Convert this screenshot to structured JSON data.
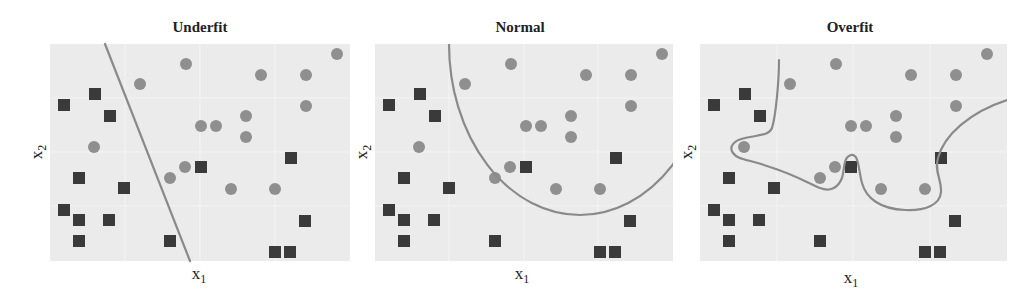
{
  "figure": {
    "colors": {
      "plot_background": "#ebebeb",
      "circle_class": "#8f8f8f",
      "square_class": "#3a3a3a",
      "boundary_line": "#8a8a8a",
      "text": "#222222"
    },
    "panels": [
      {
        "id": "underfit",
        "title": "Underfit",
        "xlabel": "x",
        "xlabel_sub": "1",
        "ylabel": "x",
        "ylabel_sub": "2",
        "boundary_type": "linear"
      },
      {
        "id": "normal",
        "title": "Normal",
        "xlabel": "x",
        "xlabel_sub": "1",
        "ylabel": "x",
        "ylabel_sub": "2",
        "boundary_type": "elliptical arc"
      },
      {
        "id": "overfit",
        "title": "Overfit",
        "xlabel": "x",
        "xlabel_sub": "1",
        "ylabel": "x",
        "ylabel_sub": "2",
        "boundary_type": "wiggly curve"
      }
    ]
  },
  "chart_data": [
    {
      "type": "scatter",
      "title": "Underfit",
      "xlabel": "x1",
      "ylabel": "x2",
      "grid": true,
      "legend": "none",
      "xlim": [
        0,
        300
      ],
      "ylim": [
        0,
        217
      ],
      "series": [
        {
          "name": "circle",
          "marker": "circle",
          "color": "#8f8f8f",
          "points": [
            [
              90,
              177
            ],
            [
              136,
              197
            ],
            [
              211,
              186
            ],
            [
              256,
              186
            ],
            [
              287,
              207
            ],
            [
              256,
              155
            ],
            [
              151,
              135
            ],
            [
              166,
              135
            ],
            [
              196,
              145
            ],
            [
              196,
              124
            ],
            [
              44,
              114
            ],
            [
              120,
              83
            ],
            [
              135,
              94
            ],
            [
              181,
              72
            ],
            [
              225,
              72
            ]
          ]
        },
        {
          "name": "square",
          "marker": "square",
          "color": "#3a3a3a",
          "points": [
            [
              14,
              156
            ],
            [
              45,
              167
            ],
            [
              60,
              145
            ],
            [
              29,
              83
            ],
            [
              74,
              73
            ],
            [
              14,
              51
            ],
            [
              29,
              41
            ],
            [
              59,
              41
            ],
            [
              29,
              20
            ],
            [
              120,
              20
            ],
            [
              151,
              94
            ],
            [
              241,
              103
            ],
            [
              255,
              40
            ],
            [
              225,
              9
            ],
            [
              240,
              9
            ]
          ]
        },
        {
          "name": "decision_boundary",
          "type": "line",
          "color": "#8a8a8a",
          "points": [
            [
              55,
              217
            ],
            [
              140,
              0
            ]
          ]
        }
      ]
    },
    {
      "type": "scatter",
      "title": "Normal",
      "xlabel": "x1",
      "ylabel": "x2",
      "grid": true,
      "legend": "none",
      "xlim": [
        0,
        298
      ],
      "ylim": [
        0,
        217
      ],
      "series": [
        {
          "name": "circle",
          "marker": "circle",
          "color": "#8f8f8f",
          "points": [
            [
              90,
              177
            ],
            [
              136,
              197
            ],
            [
              211,
              186
            ],
            [
              256,
              186
            ],
            [
              287,
              207
            ],
            [
              256,
              155
            ],
            [
              151,
              135
            ],
            [
              166,
              135
            ],
            [
              196,
              145
            ],
            [
              196,
              124
            ],
            [
              44,
              114
            ],
            [
              120,
              83
            ],
            [
              135,
              94
            ],
            [
              181,
              72
            ],
            [
              225,
              72
            ]
          ]
        },
        {
          "name": "square",
          "marker": "square",
          "color": "#3a3a3a",
          "points": [
            [
              14,
              156
            ],
            [
              45,
              167
            ],
            [
              60,
              145
            ],
            [
              29,
              83
            ],
            [
              74,
              73
            ],
            [
              14,
              51
            ],
            [
              29,
              41
            ],
            [
              59,
              41
            ],
            [
              29,
              20
            ],
            [
              120,
              20
            ],
            [
              151,
              94
            ],
            [
              241,
              103
            ],
            [
              255,
              40
            ],
            [
              225,
              9
            ],
            [
              240,
              9
            ]
          ]
        },
        {
          "name": "decision_boundary",
          "type": "ellipse_arc",
          "color": "#8a8a8a",
          "center": [
            205,
            217
          ],
          "rx": 131,
          "ry": 171
        }
      ]
    },
    {
      "type": "scatter",
      "title": "Overfit",
      "xlabel": "x1",
      "ylabel": "x2",
      "grid": true,
      "legend": "none",
      "xlim": [
        0,
        307
      ],
      "ylim": [
        0,
        217
      ],
      "series": [
        {
          "name": "circle",
          "marker": "circle",
          "color": "#8f8f8f",
          "points": [
            [
              90,
              177
            ],
            [
              136,
              197
            ],
            [
              211,
              186
            ],
            [
              256,
              186
            ],
            [
              287,
              207
            ],
            [
              256,
              155
            ],
            [
              151,
              135
            ],
            [
              166,
              135
            ],
            [
              196,
              145
            ],
            [
              196,
              124
            ],
            [
              44,
              114
            ],
            [
              120,
              83
            ],
            [
              135,
              94
            ],
            [
              181,
              72
            ],
            [
              225,
              72
            ]
          ]
        },
        {
          "name": "square",
          "marker": "square",
          "color": "#3a3a3a",
          "points": [
            [
              14,
              156
            ],
            [
              45,
              167
            ],
            [
              60,
              145
            ],
            [
              29,
              83
            ],
            [
              74,
              73
            ],
            [
              14,
              51
            ],
            [
              29,
              41
            ],
            [
              59,
              41
            ],
            [
              29,
              20
            ],
            [
              120,
              20
            ],
            [
              151,
              94
            ],
            [
              241,
              103
            ],
            [
              255,
              40
            ],
            [
              225,
              9
            ],
            [
              240,
              9
            ]
          ]
        },
        {
          "name": "decision_boundary",
          "type": "curve",
          "color": "#8a8a8a",
          "points": [
            [
              79,
              201
            ],
            [
              74,
              140
            ],
            [
              66,
              128
            ],
            [
              35,
              116
            ],
            [
              32,
              108
            ],
            [
              45,
              103
            ],
            [
              70,
              93
            ],
            [
              100,
              85
            ],
            [
              120,
              73
            ],
            [
              132,
              73
            ],
            [
              142,
              83
            ],
            [
              145,
              103
            ],
            [
              152,
              106
            ],
            [
              157,
              96
            ],
            [
              162,
              76
            ],
            [
              175,
              61
            ],
            [
              205,
              52
            ],
            [
              230,
              56
            ],
            [
              240,
              71
            ],
            [
              237,
              86
            ],
            [
              240,
              101
            ],
            [
              255,
              126
            ],
            [
              280,
              146
            ],
            [
              306,
              161
            ]
          ]
        }
      ]
    }
  ]
}
